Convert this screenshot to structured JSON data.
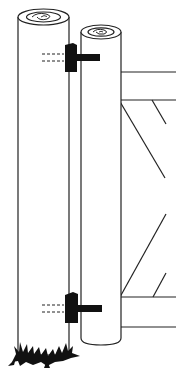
{
  "figure": {
    "colors": {
      "background": "#ffffff",
      "line": "#222222",
      "hinge": "#111111"
    },
    "components": [
      {
        "name": "fence-post",
        "label": ""
      },
      {
        "name": "gate-stile",
        "label": ""
      },
      {
        "name": "upper-hinge",
        "label": ""
      },
      {
        "name": "lower-hinge",
        "label": ""
      },
      {
        "name": "upper-gate-rail",
        "label": ""
      },
      {
        "name": "lower-gate-rail",
        "label": ""
      },
      {
        "name": "diagonal-braces",
        "label": ""
      },
      {
        "name": "grass-tuft",
        "label": ""
      }
    ]
  }
}
